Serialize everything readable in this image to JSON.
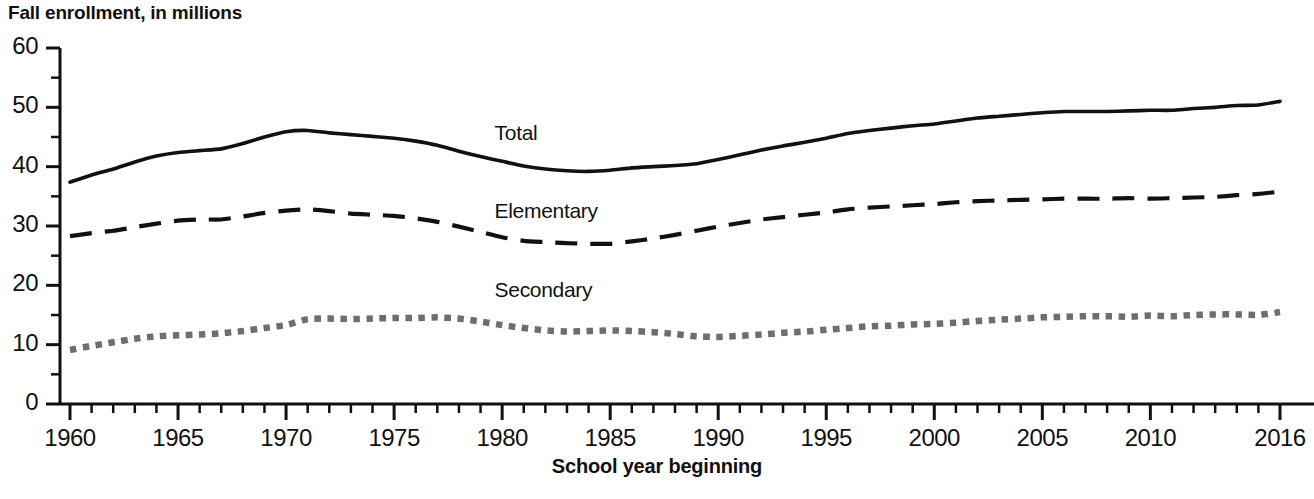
{
  "chart_data": {
    "type": "line",
    "title": "Fall enrollment, in millions",
    "xlabel": "School year beginning",
    "ylabel": "",
    "xlim": [
      1960,
      2016
    ],
    "ylim": [
      0,
      60
    ],
    "grid": false,
    "legend_position": "inline-annotations",
    "y_ticks": [
      "60",
      "50",
      "40",
      "30",
      "20",
      "10",
      "0"
    ],
    "y_tick_values": [
      60,
      50,
      40,
      30,
      20,
      10,
      0
    ],
    "y_minor_tick_values": [
      55,
      45,
      35,
      25,
      15,
      5
    ],
    "x_ticks": [
      "1960",
      "1965",
      "1970",
      "1975",
      "1980",
      "1985",
      "1990",
      "1995",
      "2000",
      "2005",
      "2010",
      "2016"
    ],
    "x_tick_values": [
      1960,
      1965,
      1970,
      1975,
      1980,
      1985,
      1990,
      1995,
      2000,
      2005,
      2010,
      2016
    ],
    "x": [
      1960,
      1961,
      1962,
      1963,
      1964,
      1965,
      1966,
      1967,
      1968,
      1969,
      1970,
      1971,
      1972,
      1973,
      1974,
      1975,
      1976,
      1977,
      1978,
      1979,
      1980,
      1981,
      1982,
      1983,
      1984,
      1985,
      1986,
      1987,
      1988,
      1989,
      1990,
      1991,
      1992,
      1993,
      1994,
      1995,
      1996,
      1997,
      1998,
      1999,
      2000,
      2001,
      2002,
      2003,
      2004,
      2005,
      2006,
      2007,
      2008,
      2009,
      2010,
      2011,
      2012,
      2013,
      2014,
      2015,
      2016
    ],
    "series": [
      {
        "name": "Total",
        "style": "solid",
        "color": "#111111",
        "label_x": 1981.5,
        "label_y": 45.5,
        "values": [
          37.4,
          38.6,
          39.6,
          40.8,
          41.8,
          42.4,
          42.7,
          43.0,
          43.9,
          45.0,
          45.9,
          46.1,
          45.7,
          45.4,
          45.1,
          44.8,
          44.3,
          43.6,
          42.6,
          41.7,
          40.9,
          40.1,
          39.6,
          39.3,
          39.2,
          39.4,
          39.8,
          40.0,
          40.2,
          40.5,
          41.2,
          42.0,
          42.8,
          43.5,
          44.1,
          44.8,
          45.6,
          46.1,
          46.5,
          46.9,
          47.2,
          47.7,
          48.2,
          48.5,
          48.8,
          49.1,
          49.3,
          49.3,
          49.3,
          49.4,
          49.5,
          49.5,
          49.8,
          50.0,
          50.3,
          50.4,
          50.4
        ],
        "final_value": 51.0
      },
      {
        "name": "Elementary",
        "style": "dashed",
        "color": "#111111",
        "label_x": 1981.5,
        "label_y": 32.3,
        "values": [
          28.3,
          28.8,
          29.2,
          29.8,
          30.4,
          30.9,
          31.1,
          31.1,
          31.6,
          32.2,
          32.6,
          32.8,
          32.5,
          32.1,
          31.9,
          31.7,
          31.3,
          30.7,
          29.9,
          29.0,
          28.1,
          27.5,
          27.3,
          27.1,
          27.0,
          27.0,
          27.4,
          27.9,
          28.5,
          29.2,
          29.9,
          30.5,
          31.1,
          31.5,
          31.9,
          32.3,
          32.8,
          33.1,
          33.3,
          33.5,
          33.7,
          34.0,
          34.2,
          34.3,
          34.4,
          34.5,
          34.6,
          34.6,
          34.6,
          34.7,
          34.6,
          34.7,
          34.8,
          34.9,
          35.2,
          35.4,
          35.5
        ],
        "final_value": 35.8
      },
      {
        "name": "Secondary",
        "style": "dotted",
        "color": "#6e6e6e",
        "label_x": 1981.5,
        "label_y": 19.0,
        "values": [
          9.1,
          9.8,
          10.4,
          11.0,
          11.4,
          11.6,
          11.7,
          11.9,
          12.3,
          12.8,
          13.3,
          14.3,
          14.4,
          14.3,
          14.4,
          14.5,
          14.5,
          14.6,
          14.4,
          13.9,
          13.3,
          12.8,
          12.4,
          12.2,
          12.3,
          12.4,
          12.3,
          12.1,
          11.8,
          11.4,
          11.3,
          11.5,
          11.7,
          12.0,
          12.2,
          12.5,
          12.8,
          13.1,
          13.2,
          13.4,
          13.5,
          13.7,
          14.0,
          14.2,
          14.4,
          14.6,
          14.7,
          14.8,
          14.8,
          14.7,
          14.9,
          14.8,
          15.0,
          15.1,
          15.1,
          15.0,
          14.9
        ],
        "final_value": 15.5
      }
    ]
  }
}
